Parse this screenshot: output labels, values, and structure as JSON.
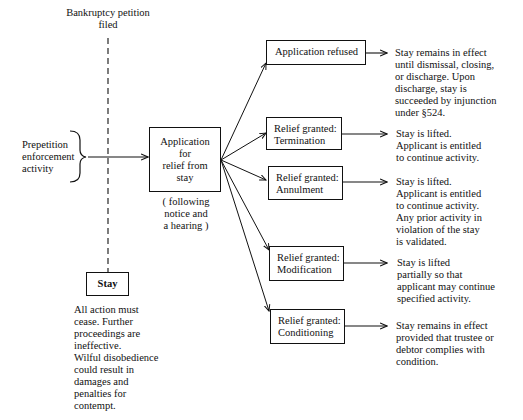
{
  "petition": {
    "label": "Bankruptcy petition\nfiled"
  },
  "prepetition": {
    "label": "Prepetition\nenforcement\nactivity"
  },
  "application": {
    "label": "Application\nfor\nrelief from\nstay",
    "note": "( following\nnotice and\na hearing )"
  },
  "stay": {
    "label": "Stay",
    "description": "All action must\ncease. Further\nproceedings are\nineffective.\nWilful disobedience\ncould result in\ndamages and\npenalties for\ncontempt."
  },
  "outcomes": [
    {
      "label": "Application refused",
      "result": "Stay remains in effect\nuntil dismissal, closing,\nor discharge. Upon\ndischarge, stay is\nsucceeded by injunction\nunder §524."
    },
    {
      "label": "Relief granted:\nTermination",
      "result": "Stay is lifted.\nApplicant is entitled\nto continue activity."
    },
    {
      "label": "Relief granted:\nAnnulment",
      "result": "Stay is lifted.\nApplicant is entitled\nto continue activity.\nAny prior activity in\nviolation of the stay\nis validated."
    },
    {
      "label": "Relief granted:\nModification",
      "result": "Stay is lifted\npartially so that\napplicant may continue\nspecified activity."
    },
    {
      "label": "Relief granted:\nConditioning",
      "result": "Stay remains in effect\nprovided that trustee or\ndebtor complies with\ncondition."
    }
  ]
}
